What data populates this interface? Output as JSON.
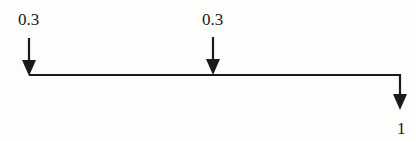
{
  "diagram": {
    "type": "beam-load-diagram",
    "loads": [
      {
        "id": "load-left",
        "label": "0.3",
        "x": 29,
        "direction": "down"
      },
      {
        "id": "load-mid",
        "label": "0.3",
        "x": 213,
        "direction": "down"
      }
    ],
    "reaction": {
      "id": "output-right",
      "label": "1",
      "x": 400,
      "direction": "down"
    },
    "beam": {
      "x_start": 29,
      "x_end": 400,
      "y": 75
    },
    "colors": {
      "stroke": "#1a1a1a",
      "background": "#fdfdfb"
    }
  }
}
